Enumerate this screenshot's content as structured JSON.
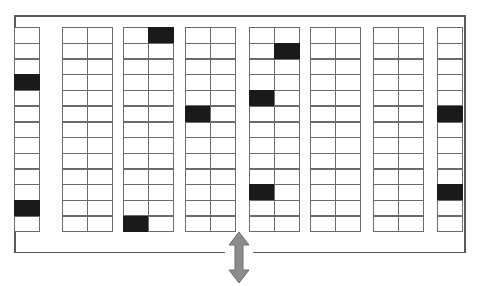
{
  "diagram": {
    "kind": "parking-lot-map",
    "rows_per_bay": 13,
    "bay_count": 8,
    "legend": {
      "occupied_label": "Occupied stall",
      "vacant_label": "Vacant stall",
      "occupied_color": "#1a1a1a",
      "vacant_color": "#ffffff",
      "outline_color": "#6b6b6b",
      "boundary_color": "#5a5a5a",
      "arrow_color": "#8c8c8c"
    },
    "entrance": {
      "name": "entrance-exit",
      "label": "Entrance / Exit",
      "icon": "double-arrow-vertical-icon",
      "position": "bottom-center"
    },
    "boundary": {
      "name": "lot-boundary",
      "label": "Lot boundary"
    },
    "bays": [
      {
        "id": "bay-1",
        "label": "Bay 1",
        "width_type": "single",
        "columns": 1,
        "rows": 13,
        "occupied": [
          [
            4,
            1
          ],
          [
            12,
            1
          ]
        ],
        "occupied_count": 2,
        "stall_count": 13
      },
      {
        "id": "bay-2",
        "label": "Bay 2",
        "width_type": "double",
        "columns": 2,
        "rows": 13,
        "occupied": [],
        "occupied_count": 0,
        "stall_count": 26
      },
      {
        "id": "bay-3",
        "label": "Bay 3",
        "width_type": "double",
        "columns": 2,
        "rows": 13,
        "occupied": [
          [
            1,
            2
          ],
          [
            13,
            1
          ]
        ],
        "occupied_count": 2,
        "stall_count": 26
      },
      {
        "id": "bay-4",
        "label": "Bay 4",
        "width_type": "double",
        "columns": 2,
        "rows": 13,
        "occupied": [
          [
            6,
            1
          ]
        ],
        "occupied_count": 1,
        "stall_count": 26
      },
      {
        "id": "bay-5",
        "label": "Bay 5",
        "width_type": "double",
        "columns": 2,
        "rows": 13,
        "occupied": [
          [
            2,
            2
          ],
          [
            5,
            1
          ],
          [
            11,
            1
          ]
        ],
        "occupied_count": 3,
        "stall_count": 26
      },
      {
        "id": "bay-6",
        "label": "Bay 6",
        "width_type": "double",
        "columns": 2,
        "rows": 13,
        "occupied": [],
        "occupied_count": 0,
        "stall_count": 26
      },
      {
        "id": "bay-7",
        "label": "Bay 7",
        "width_type": "double",
        "columns": 2,
        "rows": 13,
        "occupied": [],
        "occupied_count": 0,
        "stall_count": 26
      },
      {
        "id": "bay-8",
        "label": "Bay 8",
        "width_type": "single",
        "columns": 1,
        "rows": 13,
        "occupied": [
          [
            6,
            1
          ],
          [
            11,
            1
          ]
        ],
        "occupied_count": 2,
        "stall_count": 13
      }
    ]
  }
}
